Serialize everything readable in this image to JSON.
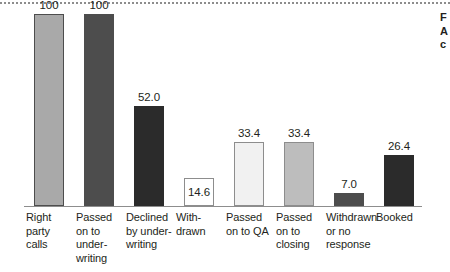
{
  "chart_data": {
    "type": "bar",
    "title": "",
    "subtitle": "",
    "xlabel": "",
    "ylabel": "",
    "ylim": [
      0,
      100
    ],
    "grid": false,
    "legend": null,
    "categories": [
      "Right party calls",
      "Passed on to underwriting",
      "Declined by underwriting",
      "Withdrawn",
      "Passed on to QA",
      "Passed on to closing",
      "Withdrawn or no response",
      "Booked"
    ],
    "category_lines": [
      [
        "Right",
        "party",
        "calls"
      ],
      [
        "Passed",
        "on to",
        "under-",
        "writing"
      ],
      [
        "Declined",
        "by under-",
        "writing"
      ],
      [
        "With-",
        "drawn"
      ],
      [
        "Passed",
        "on to QA"
      ],
      [
        "Passed",
        "on to",
        "closing"
      ],
      [
        "Withdrawn",
        "or no",
        "response"
      ],
      [
        "Booked"
      ]
    ],
    "values": [
      100,
      100,
      52.0,
      14.6,
      33.4,
      33.4,
      7.0,
      26.4
    ],
    "value_labels": [
      "100",
      "100",
      "52.0",
      "14.6",
      "33.4",
      "33.4",
      "7.0",
      "26.4"
    ],
    "bar_styles": [
      {
        "fill": "#a9a9a9",
        "stroke": "#4d4d4d",
        "label_inside": false
      },
      {
        "fill": "#4d4d4d",
        "stroke": "#4d4d4d",
        "label_inside": false
      },
      {
        "fill": "#2b2b2b",
        "stroke": "#2b2b2b",
        "label_inside": false
      },
      {
        "fill": "#ffffff",
        "stroke": "#8d8d8d",
        "label_inside": true
      },
      {
        "fill": "#f1f1f1",
        "stroke": "#8d8d8d",
        "label_inside": false
      },
      {
        "fill": "#bdbdbd",
        "stroke": "#8d8d8d",
        "label_inside": false
      },
      {
        "fill": "#4d4d4d",
        "stroke": "#4d4d4d",
        "label_inside": false
      },
      {
        "fill": "#2b2b2b",
        "stroke": "#2b2b2b",
        "label_inside": false
      }
    ]
  },
  "margin_note": {
    "lines": [
      "F",
      "A",
      "c"
    ]
  },
  "colors": {
    "axis": "#8d8d8d",
    "top_rule": "#8d8d8d",
    "text": "#231f20",
    "background": "#ffffff"
  }
}
